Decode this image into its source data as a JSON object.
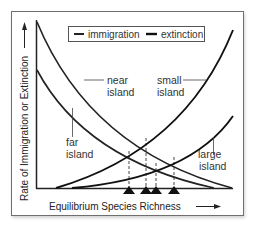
{
  "figure": {
    "legend": {
      "items": [
        {
          "label": "immigration",
          "style": "solid"
        },
        {
          "label": "extinction",
          "style": "solid"
        }
      ]
    },
    "axes": {
      "y_label": "Rate of Immigration or Extinction",
      "x_label": "Equilibrium Species Richness"
    },
    "curve_labels": {
      "near": [
        "near",
        "island"
      ],
      "far": [
        "far",
        "island"
      ],
      "small": [
        "small",
        "island"
      ],
      "large": [
        "large",
        "island"
      ]
    },
    "curves": [
      {
        "name": "immigration-near-island",
        "type": "immigration",
        "start": [
          37,
          22
        ],
        "end": [
          232,
          188
        ]
      },
      {
        "name": "immigration-far-island",
        "type": "immigration",
        "start": [
          37,
          70
        ],
        "end": [
          214,
          188
        ]
      },
      {
        "name": "extinction-small-island",
        "type": "extinction",
        "start": [
          56,
          188
        ],
        "end": [
          233,
          30
        ]
      },
      {
        "name": "extinction-large-island",
        "type": "extinction",
        "start": [
          72,
          188
        ],
        "end": [
          233,
          116
        ]
      }
    ],
    "equilibrium_markers": [
      {
        "name": "far-small",
        "x": 129,
        "y": 151
      },
      {
        "name": "near-small",
        "x": 146,
        "y": 138
      },
      {
        "name": "far-large",
        "x": 156,
        "y": 163
      },
      {
        "name": "near-large",
        "x": 174,
        "y": 157
      }
    ],
    "colors": {
      "curve": "#222222",
      "frame": "#6f6f6f",
      "text": "#333333"
    }
  }
}
